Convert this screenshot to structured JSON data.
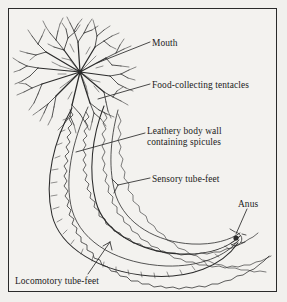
{
  "figure": {
    "kind": "anatomy-diagram",
    "background_color": "#f1f0ed",
    "frame_color": "#2a2a2a",
    "ink_color": "#2b2b2b"
  },
  "labels": {
    "mouth": "Mouth",
    "tentacles": "Food-collecting tentacles",
    "body_wall_line1": "Leathery body wall",
    "body_wall_line2": "containing spicules",
    "sensory": "Sensory tube-feet",
    "anus": "Anus",
    "locomotory": "Locomotory tube-feet"
  },
  "leaders": [
    {
      "name": "mouth",
      "from": [
        150,
        42
      ],
      "to": [
        97,
        63
      ]
    },
    {
      "name": "tentacles",
      "from": [
        150,
        84
      ],
      "to": [
        98,
        99
      ]
    },
    {
      "name": "body-wall",
      "from": [
        145,
        133
      ],
      "to": [
        76,
        152
      ]
    },
    {
      "name": "sensory",
      "from": [
        150,
        178
      ],
      "to": [
        118,
        185
      ]
    },
    {
      "name": "anus",
      "from": [
        247,
        209
      ],
      "to": [
        236,
        237
      ]
    },
    {
      "name": "locomotory",
      "from": [
        88,
        274
      ],
      "to": [
        110,
        242
      ]
    }
  ]
}
